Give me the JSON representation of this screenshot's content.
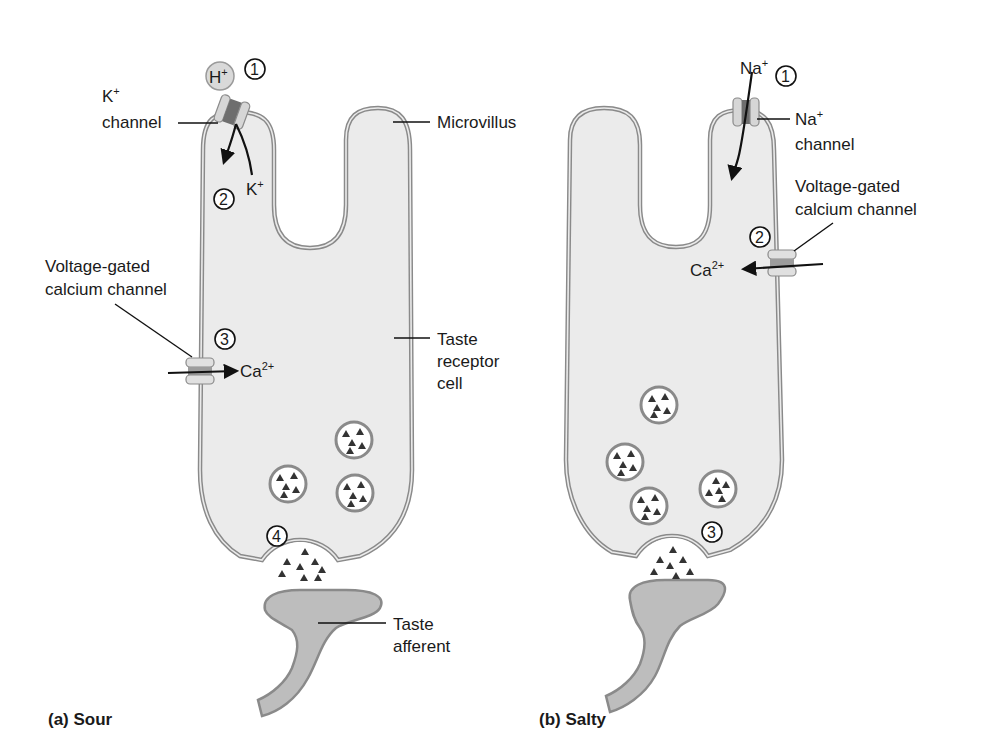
{
  "colors": {
    "cell_fill": "#ebebeb",
    "membrane": "#8a8a8a",
    "afferent_fill": "#bdbdbd",
    "channel_light": "#d6d6d6",
    "channel_dark": "#6e6e6e",
    "vesicle_fill": "#ffffff",
    "transmitter": "#333333",
    "ion_ball": "#d9d9d9"
  },
  "panels": [
    {
      "caption": "(a) Sour",
      "labels": {
        "ion": "H",
        "ion_sup": "+",
        "k_channel_line1": "K",
        "k_channel_line1_sup": "+",
        "k_channel_line2": "channel",
        "k_out": "K",
        "k_out_sup": "+",
        "microvillus": "Microvillus",
        "vgcc_line1": "Voltage-gated",
        "vgcc_line2": "calcium channel",
        "ca": "Ca",
        "ca_sup": "2+",
        "receptor_line1": "Taste",
        "receptor_line2": "receptor",
        "receptor_line3": "cell",
        "afferent_line1": "Taste",
        "afferent_line2": "afferent"
      },
      "steps": [
        "1",
        "2",
        "3",
        "4"
      ],
      "vesicle_count": 3
    },
    {
      "caption": "(b) Salty",
      "labels": {
        "ion": "Na",
        "ion_sup": "+",
        "na_channel_line1": "Na",
        "na_channel_line1_sup": "+",
        "na_channel_line2": "channel",
        "vgcc_line1": "Voltage-gated",
        "vgcc_line2": "calcium channel",
        "ca": "Ca",
        "ca_sup": "2+"
      },
      "steps": [
        "1",
        "2",
        "3"
      ],
      "vesicle_count": 4
    }
  ]
}
